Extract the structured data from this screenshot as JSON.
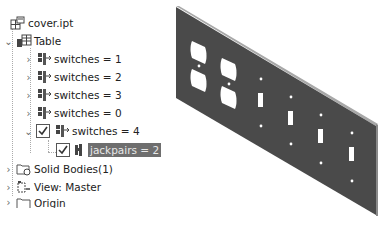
{
  "browser": {
    "root": {
      "label": "cover.ipt",
      "icon": "part-file-icon"
    },
    "table": {
      "label": "Table",
      "icon": "table-icon",
      "expanded": true
    },
    "rows": [
      {
        "label": "switches = 1",
        "icon": "config-row-icon",
        "checked": false,
        "expanded": false
      },
      {
        "label": "switches = 2",
        "icon": "config-row-icon",
        "checked": false,
        "expanded": false
      },
      {
        "label": "switches = 3",
        "icon": "config-row-icon",
        "checked": false,
        "expanded": false
      },
      {
        "label": "switches = 0",
        "icon": "config-row-icon",
        "checked": false,
        "expanded": false
      },
      {
        "label": "switches = 4",
        "icon": "config-row-icon",
        "checked": true,
        "expanded": true
      }
    ],
    "sub_row": {
      "label": "jackpairs = 2",
      "icon": "parameter-icon",
      "checked": true,
      "selected": true
    },
    "folders": [
      {
        "label": "Solid Bodies(1)",
        "icon": "solid-bodies-folder-icon"
      },
      {
        "label": "View: Master",
        "icon": "view-rep-icon"
      },
      {
        "label": "Origin",
        "icon": "origin-folder-icon"
      }
    ]
  },
  "model": {
    "name": "cover plate",
    "duplex_outlets": 2,
    "toggle_switches": 4,
    "colors": {
      "plate": "#4a4a4a",
      "edge": "#9a9a9a",
      "highlight_bg": "#6e6e6e"
    }
  }
}
